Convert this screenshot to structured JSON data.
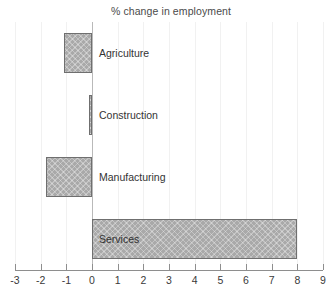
{
  "chart_data": {
    "type": "bar",
    "orientation": "horizontal",
    "title": "% change in employment",
    "xlabel": "",
    "ylabel": "",
    "categories": [
      "Agriculture",
      "Construction",
      "Manufacturing",
      "Services"
    ],
    "values": [
      -1.1,
      -0.1,
      -1.8,
      8.0
    ],
    "xlim": [
      -3,
      9
    ],
    "xticks": [
      -3,
      -2,
      -1,
      0,
      1,
      2,
      3,
      4,
      5,
      6,
      7,
      8,
      9
    ],
    "xtick_labels": [
      "-3",
      "-2",
      "-1",
      "0",
      "1",
      "2",
      "3",
      "4",
      "5",
      "6",
      "7",
      "8",
      "9"
    ],
    "grid": true,
    "grid_axis": "x",
    "legend": null,
    "bar_fill_color": "#a9a9a9",
    "bar_edge_color": "#6f6f6f",
    "gridline_color": "#f1f1f1",
    "zero_line_color": "#b9b9b9",
    "axis_color": "#8e8e8e",
    "background_color": "#ffffff",
    "labels_inside_plot": true
  }
}
